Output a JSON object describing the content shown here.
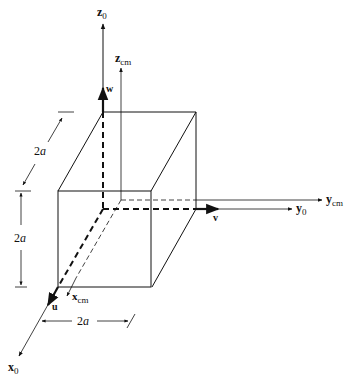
{
  "diagram": {
    "type": "3D coordinate frame with rectangular box",
    "axes": {
      "z0": {
        "base": "z",
        "sub": "0"
      },
      "zcm": {
        "base": "z",
        "sub": "cm"
      },
      "y0": {
        "base": "y",
        "sub": "0"
      },
      "ycm": {
        "base": "y",
        "sub": "cm"
      },
      "x0": {
        "base": "x",
        "sub": "0"
      },
      "xcm": {
        "base": "x",
        "sub": "cm"
      }
    },
    "unit_vectors": {
      "w": "w",
      "v": "v",
      "u": "u"
    },
    "dimensions": {
      "depth": {
        "num": "2",
        "var": "a"
      },
      "height": {
        "num": "2",
        "var": "a"
      },
      "width": {
        "num": "2",
        "var": "a"
      }
    },
    "colors": {
      "line": "#111111",
      "background": "#ffffff"
    }
  }
}
